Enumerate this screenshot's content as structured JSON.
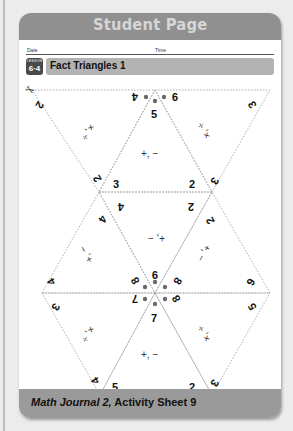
{
  "header": {
    "title": "Student Page"
  },
  "form": {
    "date_label": "Date",
    "time_label": "Time"
  },
  "lesson": {
    "badge_label": "LESSON",
    "badge_number": "6·4",
    "title": "Fact Triangles 1"
  },
  "icons": {
    "scissors": "✂"
  },
  "fact_triangles": [
    {
      "position": "top-left",
      "operations": "×, ÷",
      "numbers": [
        "2",
        "2",
        "4"
      ],
      "product": "4"
    },
    {
      "position": "top-center",
      "operations": "+, −",
      "numbers": [
        "5",
        "3",
        "2"
      ],
      "sum": "5"
    },
    {
      "position": "top-right",
      "operations": "×, ÷",
      "numbers": [
        "3",
        "3",
        "9"
      ],
      "product": "9"
    },
    {
      "position": "middle-left",
      "operations": "+, −",
      "numbers": [
        "4",
        "4",
        "8"
      ],
      "sum": "8"
    },
    {
      "position": "middle-center",
      "operations": "+, −",
      "numbers": [
        "4",
        "2",
        "9"
      ],
      "note": "upside-down label ‘− ,+’"
    },
    {
      "position": "middle-right",
      "operations": "+, −",
      "numbers": [
        "2",
        "6",
        "8"
      ],
      "sum": "8"
    },
    {
      "position": "bottom-left",
      "operations": "×, ÷",
      "numbers": [
        "3",
        "4",
        "7"
      ],
      "note": "shown value 7"
    },
    {
      "position": "bottom-center",
      "operations": "+, −",
      "numbers": [
        "7",
        "5",
        "2"
      ],
      "sum": "7"
    },
    {
      "position": "bottom-right",
      "operations": "×, ÷",
      "numbers": [
        "5",
        "3",
        "8"
      ],
      "note": "shown value 8"
    }
  ],
  "labels": {
    "top_left_a": "2",
    "top_left_b": "2",
    "top_left_c": "4",
    "top_left_op": "×, ÷",
    "top_center_top": "5",
    "top_center_l": "3",
    "top_center_r": "2",
    "top_center_op": "+, −",
    "top_right_a": "3",
    "top_right_b": "3",
    "top_right_c": "9",
    "top_right_op": "×, ÷",
    "mid_left_a": "4",
    "mid_left_b": "4",
    "mid_left_c": "8",
    "mid_left_op": "+, −",
    "mid_center_l": "4",
    "mid_center_r": "2",
    "mid_center_bottom": "9",
    "mid_center_op": "+, −",
    "mid_right_a": "2",
    "mid_right_b": "6",
    "mid_right_c": "8",
    "mid_right_op": "+, −",
    "bot_left_a": "3",
    "bot_left_b": "4",
    "bot_left_c": "7",
    "bot_left_op": "×, ÷",
    "bot_center_top": "7",
    "bot_center_l": "5",
    "bot_center_r": "2",
    "bot_center_op": "+, −",
    "bot_right_a": "5",
    "bot_right_b": "3",
    "bot_right_c": "8",
    "bot_right_op": "×, ÷"
  },
  "footer": {
    "source_italic": "Math Journal 2,",
    "source_rest": " Activity Sheet 9"
  }
}
